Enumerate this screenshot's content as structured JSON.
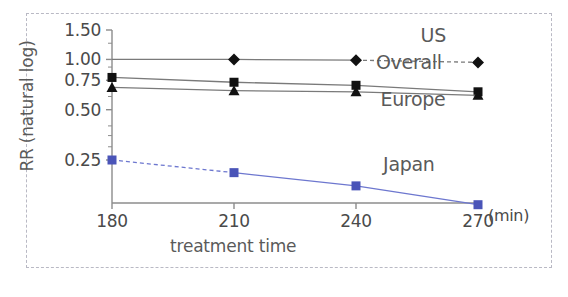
{
  "chart_data": {
    "type": "line",
    "title": "",
    "xlabel": "treatment time",
    "xunit": "(min)",
    "ylabel": "RR (natural log)",
    "x": [
      180,
      210,
      240,
      270
    ],
    "xticklabels": [
      "180",
      "210",
      "240",
      "270"
    ],
    "yticks": [
      1.5,
      1.0,
      0.75,
      0.5,
      0.25
    ],
    "yticklabels": [
      "1.50",
      "1.00",
      "0.75",
      "0.50",
      "0.25"
    ],
    "yscale": "log",
    "ylim": [
      0.1,
      1.72
    ],
    "xlim": [
      172,
      282
    ],
    "grid": false,
    "legend_position": "inline-right",
    "series": [
      {
        "name": "US",
        "label": "US",
        "marker": "diamond",
        "color": "#111111",
        "linecolor": "#7a7a7a",
        "values": [
          1.0,
          1.0,
          0.99,
          0.96
        ],
        "dashed_segments": [
          [
            240,
            270
          ]
        ]
      },
      {
        "name": "Overall",
        "label": "Overall",
        "marker": "square",
        "color": "#111111",
        "linecolor": "#7a7a7a",
        "values": [
          0.78,
          0.73,
          0.7,
          0.64
        ],
        "dashed_segments": []
      },
      {
        "name": "Europe",
        "label": "Europe",
        "marker": "triangle",
        "color": "#111111",
        "linecolor": "#7a7a7a",
        "values": [
          0.68,
          0.65,
          0.64,
          0.61
        ],
        "dashed_segments": []
      },
      {
        "name": "Japan",
        "label": "Japan",
        "marker": "square",
        "color": "#4a54b8",
        "linecolor": "#6d77cf",
        "values": [
          0.25,
          0.21,
          0.175,
          0.135
        ],
        "dashed_segments": [
          [
            180,
            210
          ]
        ]
      }
    ],
    "annotations": [
      {
        "text": "US",
        "x": 259,
        "y": 1.28
      },
      {
        "text": "Overall",
        "x": 253,
        "y": 0.88
      },
      {
        "text": "Europe",
        "x": 254,
        "y": 0.525
      },
      {
        "text": "Japan",
        "x": 253,
        "y": 0.215
      }
    ]
  },
  "figure": {
    "border_color": "#b9b9c4",
    "background": "#ffffff",
    "axis_color": "#8c8c8c",
    "tick_text_color": "#4a4a4a",
    "label_text_color": "#5a5a5a"
  }
}
